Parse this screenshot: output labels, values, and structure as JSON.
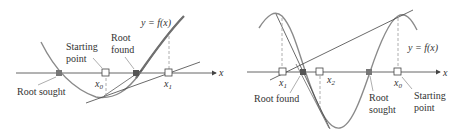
{
  "panels": [
    {
      "id": "left",
      "curve_label": "y = f(x)",
      "axis_label": "x",
      "labels": {
        "starting_point": [
          "Starting",
          "point"
        ],
        "root_found": [
          "Root",
          "found"
        ],
        "root_sought": "Root sought"
      },
      "points": [
        {
          "name": "x",
          "sub": "0"
        },
        {
          "name": "x",
          "sub": "1"
        }
      ]
    },
    {
      "id": "right",
      "curve_label": "y = f(x)",
      "axis_label": "x",
      "labels": {
        "root_found": "Root found",
        "root_sought": [
          "Root",
          "sought"
        ],
        "starting_point": [
          "Starting",
          "point"
        ]
      },
      "points": [
        {
          "name": "x",
          "sub": "1"
        },
        {
          "name": "x",
          "sub": "2"
        },
        {
          "name": "x",
          "sub": "0"
        }
      ]
    }
  ],
  "colors": {
    "curve": "#8a8a8a",
    "axis": "#555555",
    "tangent": "#444444",
    "root_marker": "#666666",
    "dashed": "#999999"
  }
}
